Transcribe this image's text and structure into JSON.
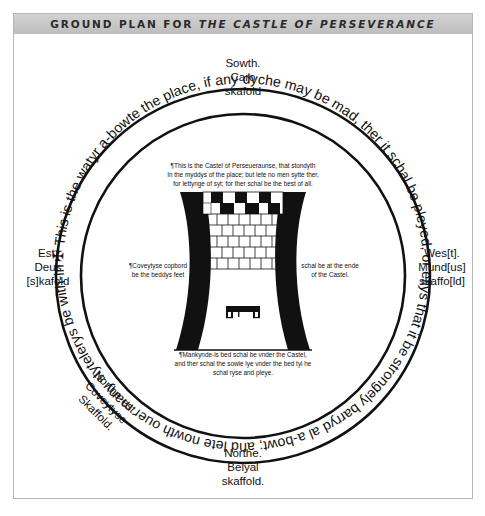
{
  "figure": {
    "title_prefix": "GROUND PLAN FOR ",
    "title_italic": "THE CASTLE OF PERSEVERANCE"
  },
  "scaffolds": {
    "south": {
      "lines": [
        "Sowth.",
        "Caro",
        "skafold"
      ]
    },
    "east": {
      "lines": [
        "Est.",
        "Deus",
        "[s]kafold"
      ]
    },
    "west": {
      "lines": [
        "Wes[t].",
        "Mund[us]",
        "skaffo[ld]"
      ]
    },
    "northeast": {
      "lines": [
        "Northe-est.",
        "Coveytyse",
        "Skaffold."
      ]
    },
    "north": {
      "lines": [
        "Northe.",
        "Belyal",
        "skaffold."
      ]
    }
  },
  "ring": {
    "cross_icon": "✠",
    "text": "This is the watyr a-bowte the place, if any dyche may be mad, ther it schal be pleyed, or ellys that it be strongely barryd al a-bowt; and lete nowth ouer many stytelerys be with-inne the plase."
  },
  "notes": {
    "castle_top": [
      "¶This is the Castel of Perseueraunse, that stondyth",
      "In the myddys of the place; but lete no men sytte ther,",
      "for lettynge of syt; for ther schal be the best of all."
    ],
    "covetise_cupboard": [
      "¶Coveytyse copbord",
      "be the beddys feet"
    ],
    "ende_of_castel": [
      "schal be at the ende",
      "of the Castel."
    ],
    "mankynde_bed": [
      "¶Mankynde-is bed schal be vnder the Castel,",
      "and ther schal the sowle lye vnder the bed tyl he",
      "schal ryse and pleye."
    ]
  },
  "colors": {
    "ink": "#111111",
    "title_band": "#c8c8c8",
    "frame_border": "#b8b8b8"
  }
}
